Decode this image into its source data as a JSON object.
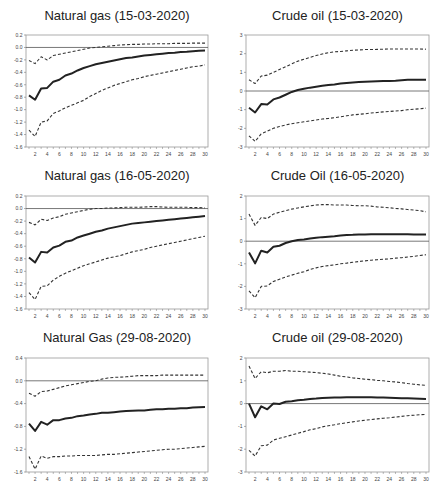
{
  "chart_data": [
    {
      "type": "line",
      "title": "Natural gas (15-03-2020)",
      "x": [
        1,
        2,
        3,
        4,
        5,
        6,
        7,
        8,
        9,
        10,
        11,
        12,
        13,
        14,
        15,
        16,
        17,
        18,
        19,
        20,
        21,
        22,
        23,
        24,
        25,
        26,
        27,
        28,
        29,
        30
      ],
      "xticks": [
        2,
        4,
        6,
        8,
        10,
        12,
        14,
        16,
        18,
        20,
        22,
        24,
        26,
        28,
        30
      ],
      "ylim": [
        -1.6,
        0.2
      ],
      "yticks": [
        0.2,
        0.0,
        -0.2,
        -0.4,
        -0.6,
        -0.8,
        -1.0,
        -1.2,
        -1.4,
        -1.6
      ],
      "ytick_labels": [
        "0.2",
        "0.0",
        "-0.2",
        "-0.4",
        "-0.6",
        "-0.8",
        "-1.0",
        "-1.2",
        "-1.4",
        "-1.6"
      ],
      "zero_line": true,
      "series": [
        {
          "name": "response",
          "style": "solid",
          "values": [
            -0.77,
            -0.84,
            -0.66,
            -0.65,
            -0.55,
            -0.52,
            -0.45,
            -0.42,
            -0.37,
            -0.33,
            -0.3,
            -0.27,
            -0.25,
            -0.23,
            -0.21,
            -0.19,
            -0.17,
            -0.16,
            -0.145,
            -0.13,
            -0.12,
            -0.11,
            -0.1,
            -0.09,
            -0.085,
            -0.075,
            -0.07,
            -0.06,
            -0.055,
            -0.05
          ]
        },
        {
          "name": "upper band",
          "style": "dashed",
          "values": [
            -0.21,
            -0.26,
            -0.15,
            -0.2,
            -0.13,
            -0.11,
            -0.09,
            -0.07,
            -0.05,
            -0.03,
            -0.01,
            0.0,
            0.01,
            0.02,
            0.03,
            0.04,
            0.045,
            0.05,
            0.05,
            0.055,
            0.055,
            0.06,
            0.06,
            0.06,
            0.065,
            0.065,
            0.065,
            0.07,
            0.07,
            0.07
          ]
        },
        {
          "name": "lower band",
          "style": "dashed",
          "values": [
            -1.33,
            -1.43,
            -1.2,
            -1.18,
            -1.06,
            -1.02,
            -0.97,
            -0.93,
            -0.89,
            -0.85,
            -0.79,
            -0.74,
            -0.69,
            -0.65,
            -0.61,
            -0.58,
            -0.55,
            -0.52,
            -0.5,
            -0.47,
            -0.45,
            -0.43,
            -0.41,
            -0.39,
            -0.37,
            -0.35,
            -0.33,
            -0.31,
            -0.3,
            -0.28
          ]
        }
      ]
    },
    {
      "type": "line",
      "title": "Crude oil (15-03-2020)",
      "x": [
        1,
        2,
        3,
        4,
        5,
        6,
        7,
        8,
        9,
        10,
        11,
        12,
        13,
        14,
        15,
        16,
        17,
        18,
        19,
        20,
        21,
        22,
        23,
        24,
        25,
        26,
        27,
        28,
        29,
        30
      ],
      "xticks": [
        2,
        4,
        6,
        8,
        10,
        12,
        14,
        16,
        18,
        20,
        22,
        24,
        26,
        28,
        30
      ],
      "ylim": [
        -3,
        3
      ],
      "yticks": [
        3,
        2,
        1,
        0,
        -1,
        -2,
        -3
      ],
      "ytick_labels": [
        "3",
        "2",
        "1",
        "0",
        "-1",
        "-2",
        "-3"
      ],
      "zero_line": true,
      "series": [
        {
          "name": "response",
          "style": "solid",
          "values": [
            -0.9,
            -1.15,
            -0.7,
            -0.72,
            -0.45,
            -0.35,
            -0.2,
            -0.05,
            0.05,
            0.12,
            0.18,
            0.23,
            0.28,
            0.32,
            0.35,
            0.4,
            0.43,
            0.46,
            0.48,
            0.5,
            0.51,
            0.52,
            0.53,
            0.54,
            0.55,
            0.58,
            0.6,
            0.6,
            0.6,
            0.6
          ]
        },
        {
          "name": "upper band",
          "style": "dashed",
          "values": [
            0.6,
            0.4,
            0.8,
            0.85,
            1.0,
            1.15,
            1.3,
            1.45,
            1.6,
            1.7,
            1.8,
            1.9,
            1.98,
            2.05,
            2.1,
            2.12,
            2.15,
            2.18,
            2.2,
            2.22,
            2.22,
            2.23,
            2.24,
            2.25,
            2.25,
            2.25,
            2.25,
            2.25,
            2.25,
            2.24
          ]
        },
        {
          "name": "lower band",
          "style": "dashed",
          "values": [
            -2.4,
            -2.7,
            -2.3,
            -2.15,
            -2.0,
            -1.9,
            -1.82,
            -1.75,
            -1.7,
            -1.65,
            -1.6,
            -1.55,
            -1.5,
            -1.47,
            -1.43,
            -1.38,
            -1.33,
            -1.28,
            -1.25,
            -1.22,
            -1.18,
            -1.15,
            -1.12,
            -1.1,
            -1.07,
            -1.05,
            -1.0,
            -0.98,
            -0.95,
            -0.92
          ]
        }
      ]
    },
    {
      "type": "line",
      "title": "Natural gas (16-05-2020)",
      "x": [
        1,
        2,
        3,
        4,
        5,
        6,
        7,
        8,
        9,
        10,
        11,
        12,
        13,
        14,
        15,
        16,
        17,
        18,
        19,
        20,
        21,
        22,
        23,
        24,
        25,
        26,
        27,
        28,
        29,
        30
      ],
      "xticks": [
        2,
        4,
        6,
        8,
        10,
        12,
        14,
        16,
        18,
        20,
        22,
        24,
        26,
        28,
        30
      ],
      "ylim": [
        -1.6,
        0.2
      ],
      "yticks": [
        0.2,
        0.0,
        -0.2,
        -0.4,
        -0.6,
        -0.8,
        -1.0,
        -1.2,
        -1.4,
        -1.6
      ],
      "ytick_labels": [
        "0.2",
        "0.0",
        "-0.2",
        "-0.4",
        "-0.6",
        "-0.8",
        "-1.0",
        "-1.2",
        "-1.4",
        "-1.6"
      ],
      "zero_line": true,
      "series": [
        {
          "name": "response",
          "style": "solid",
          "values": [
            -0.78,
            -0.86,
            -0.69,
            -0.7,
            -0.62,
            -0.59,
            -0.53,
            -0.51,
            -0.46,
            -0.43,
            -0.4,
            -0.37,
            -0.35,
            -0.32,
            -0.3,
            -0.28,
            -0.26,
            -0.24,
            -0.23,
            -0.22,
            -0.21,
            -0.2,
            -0.19,
            -0.18,
            -0.17,
            -0.16,
            -0.15,
            -0.14,
            -0.13,
            -0.12
          ]
        },
        {
          "name": "upper band",
          "style": "dashed",
          "values": [
            -0.22,
            -0.26,
            -0.17,
            -0.19,
            -0.15,
            -0.13,
            -0.09,
            -0.07,
            -0.05,
            -0.03,
            -0.01,
            0.0,
            0.0,
            0.01,
            0.01,
            0.015,
            0.02,
            0.02,
            0.02,
            0.025,
            0.03,
            0.03,
            0.025,
            0.02,
            0.02,
            0.02,
            0.02,
            0.015,
            0.015,
            0.01
          ]
        },
        {
          "name": "lower band",
          "style": "dashed",
          "values": [
            -1.34,
            -1.45,
            -1.24,
            -1.23,
            -1.14,
            -1.08,
            -1.03,
            -0.99,
            -0.95,
            -0.91,
            -0.88,
            -0.85,
            -0.82,
            -0.79,
            -0.77,
            -0.75,
            -0.72,
            -0.69,
            -0.67,
            -0.65,
            -0.62,
            -0.6,
            -0.58,
            -0.56,
            -0.54,
            -0.52,
            -0.5,
            -0.48,
            -0.46,
            -0.44
          ]
        }
      ]
    },
    {
      "type": "line",
      "title": "Crude Oil (16-05-2020)",
      "x": [
        1,
        2,
        3,
        4,
        5,
        6,
        7,
        8,
        9,
        10,
        11,
        12,
        13,
        14,
        15,
        16,
        17,
        18,
        19,
        20,
        21,
        22,
        23,
        24,
        25,
        26,
        27,
        28,
        29,
        30
      ],
      "xticks": [
        2,
        4,
        6,
        8,
        10,
        12,
        14,
        16,
        18,
        20,
        22,
        24,
        26,
        28,
        30
      ],
      "ylim": [
        -3,
        2
      ],
      "yticks": [
        2,
        1,
        0,
        -1,
        -2,
        -3
      ],
      "ytick_labels": [
        "2",
        "1",
        "0",
        "-1",
        "-2",
        "-3"
      ],
      "zero_line": true,
      "series": [
        {
          "name": "response",
          "style": "solid",
          "values": [
            -0.5,
            -0.98,
            -0.42,
            -0.5,
            -0.25,
            -0.2,
            -0.08,
            0.0,
            0.05,
            0.08,
            0.12,
            0.15,
            0.18,
            0.2,
            0.22,
            0.25,
            0.27,
            0.28,
            0.3,
            0.3,
            0.31,
            0.31,
            0.31,
            0.31,
            0.31,
            0.31,
            0.31,
            0.3,
            0.3,
            0.3
          ]
        },
        {
          "name": "upper band",
          "style": "dashed",
          "values": [
            1.2,
            0.7,
            1.05,
            1.0,
            1.2,
            1.28,
            1.35,
            1.42,
            1.47,
            1.52,
            1.56,
            1.6,
            1.62,
            1.62,
            1.6,
            1.6,
            1.6,
            1.58,
            1.57,
            1.57,
            1.55,
            1.52,
            1.5,
            1.48,
            1.45,
            1.43,
            1.4,
            1.38,
            1.35,
            1.3
          ]
        },
        {
          "name": "lower band",
          "style": "dashed",
          "values": [
            -2.2,
            -2.5,
            -2.0,
            -1.98,
            -1.78,
            -1.68,
            -1.58,
            -1.5,
            -1.42,
            -1.35,
            -1.25,
            -1.18,
            -1.12,
            -1.08,
            -1.05,
            -1.0,
            -0.97,
            -0.93,
            -0.9,
            -0.87,
            -0.84,
            -0.82,
            -0.8,
            -0.78,
            -0.75,
            -0.73,
            -0.7,
            -0.67,
            -0.63,
            -0.6
          ]
        }
      ]
    },
    {
      "type": "line",
      "title": "Natural Gas (29-08-2020)",
      "x": [
        1,
        2,
        3,
        4,
        5,
        6,
        7,
        8,
        9,
        10,
        11,
        12,
        13,
        14,
        15,
        16,
        17,
        18,
        19,
        20,
        21,
        22,
        23,
        24,
        25,
        26,
        27,
        28,
        29,
        30
      ],
      "xticks": [
        2,
        4,
        6,
        8,
        10,
        12,
        14,
        16,
        18,
        20,
        22,
        24,
        26,
        28,
        30
      ],
      "ylim": [
        -1.6,
        0.4
      ],
      "yticks": [
        0.4,
        0.0,
        -0.4,
        -0.8,
        -1.2,
        -1.6
      ],
      "ytick_labels": [
        "0.4",
        "0.0",
        "-0.4",
        "-0.8",
        "-1.2",
        "-1.6"
      ],
      "zero_line": true,
      "series": [
        {
          "name": "response",
          "style": "solid",
          "values": [
            -0.75,
            -0.88,
            -0.72,
            -0.77,
            -0.69,
            -0.69,
            -0.66,
            -0.65,
            -0.62,
            -0.61,
            -0.59,
            -0.58,
            -0.56,
            -0.56,
            -0.55,
            -0.54,
            -0.53,
            -0.525,
            -0.52,
            -0.52,
            -0.51,
            -0.5,
            -0.5,
            -0.49,
            -0.49,
            -0.48,
            -0.48,
            -0.47,
            -0.465,
            -0.46
          ]
        },
        {
          "name": "upper band",
          "style": "dashed",
          "values": [
            -0.22,
            -0.27,
            -0.19,
            -0.18,
            -0.15,
            -0.12,
            -0.09,
            -0.07,
            -0.05,
            -0.03,
            -0.01,
            0.0,
            0.03,
            0.05,
            0.06,
            0.065,
            0.07,
            0.08,
            0.09,
            0.09,
            0.09,
            0.09,
            0.1,
            0.1,
            0.1,
            0.1,
            0.1,
            0.1,
            0.1,
            0.1
          ]
        },
        {
          "name": "lower band",
          "style": "dashed",
          "values": [
            -1.33,
            -1.55,
            -1.32,
            -1.36,
            -1.33,
            -1.33,
            -1.32,
            -1.32,
            -1.31,
            -1.31,
            -1.31,
            -1.31,
            -1.3,
            -1.29,
            -1.29,
            -1.28,
            -1.27,
            -1.26,
            -1.25,
            -1.24,
            -1.23,
            -1.22,
            -1.21,
            -1.2,
            -1.2,
            -1.19,
            -1.18,
            -1.17,
            -1.16,
            -1.15
          ]
        }
      ]
    },
    {
      "type": "line",
      "title": "Crude oil (29-08-2020)",
      "x": [
        1,
        2,
        3,
        4,
        5,
        6,
        7,
        8,
        9,
        10,
        11,
        12,
        13,
        14,
        15,
        16,
        17,
        18,
        19,
        20,
        21,
        22,
        23,
        24,
        25,
        26,
        27,
        28,
        29,
        30
      ],
      "xticks": [
        2,
        4,
        6,
        8,
        10,
        12,
        14,
        16,
        18,
        20,
        22,
        24,
        26,
        28,
        30
      ],
      "ylim": [
        -3,
        2
      ],
      "yticks": [
        2,
        1,
        0,
        -1,
        -2,
        -3
      ],
      "ytick_labels": [
        "2",
        "1",
        "0",
        "-1",
        "-2",
        "-3"
      ],
      "zero_line": true,
      "series": [
        {
          "name": "response",
          "style": "solid",
          "values": [
            0.0,
            -0.6,
            -0.12,
            -0.25,
            0.0,
            -0.02,
            0.08,
            0.1,
            0.15,
            0.17,
            0.2,
            0.22,
            0.25,
            0.26,
            0.27,
            0.27,
            0.28,
            0.28,
            0.28,
            0.28,
            0.28,
            0.27,
            0.27,
            0.26,
            0.25,
            0.24,
            0.23,
            0.22,
            0.21,
            0.2
          ]
        },
        {
          "name": "upper band",
          "style": "dashed",
          "values": [
            1.65,
            1.1,
            1.4,
            1.35,
            1.42,
            1.42,
            1.45,
            1.42,
            1.42,
            1.4,
            1.38,
            1.36,
            1.33,
            1.3,
            1.25,
            1.2,
            1.17,
            1.13,
            1.1,
            1.07,
            1.05,
            1.02,
            1.0,
            0.97,
            0.95,
            0.92,
            0.88,
            0.85,
            0.82,
            0.8
          ]
        },
        {
          "name": "lower band",
          "style": "dashed",
          "values": [
            -2.05,
            -2.3,
            -1.85,
            -1.82,
            -1.6,
            -1.52,
            -1.45,
            -1.38,
            -1.3,
            -1.23,
            -1.15,
            -1.1,
            -1.02,
            -0.97,
            -0.93,
            -0.88,
            -0.84,
            -0.8,
            -0.76,
            -0.73,
            -0.7,
            -0.67,
            -0.64,
            -0.62,
            -0.59,
            -0.56,
            -0.53,
            -0.51,
            -0.49,
            -0.47
          ]
        }
      ]
    }
  ],
  "layout": {
    "panels": [
      {
        "left": 26,
        "top": 35,
        "width": 182,
        "height": 112,
        "title_top": 8
      },
      {
        "left": 246,
        "top": 35,
        "width": 183,
        "height": 112,
        "title_top": 8
      },
      {
        "left": 26,
        "top": 196,
        "width": 182,
        "height": 113,
        "title_top": 168
      },
      {
        "left": 246,
        "top": 196,
        "width": 183,
        "height": 113,
        "title_top": 168
      },
      {
        "left": 26,
        "top": 358,
        "width": 182,
        "height": 114,
        "title_top": 330
      },
      {
        "left": 246,
        "top": 358,
        "width": 183,
        "height": 114,
        "title_top": 330
      }
    ]
  }
}
